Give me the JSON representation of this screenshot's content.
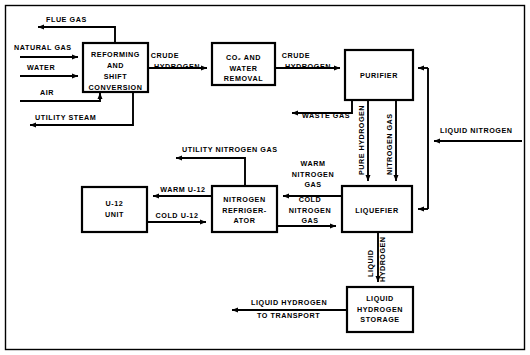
{
  "diagram": {
    "type": "process-flow-block-diagram",
    "colors": {
      "line": "#000000",
      "box_fill": "#ffffff",
      "background": "#ffffff"
    },
    "boxes": [
      {
        "id": "reforming",
        "lines": [
          "REFORMING",
          "AND",
          "SHIFT",
          "CONVERSION"
        ]
      },
      {
        "id": "co2-water",
        "lines": [
          "CO₂ AND",
          "WATER",
          "REMOVAL"
        ]
      },
      {
        "id": "purifier",
        "lines": [
          "PURIFIER"
        ]
      },
      {
        "id": "u12",
        "lines": [
          "U-12",
          "UNIT"
        ]
      },
      {
        "id": "nitrogen-refrigerator",
        "lines": [
          "NITROGEN",
          "REFRIGER-",
          "ATOR"
        ]
      },
      {
        "id": "liquefier",
        "lines": [
          "LIQUEFIER"
        ]
      },
      {
        "id": "lh2-storage",
        "lines": [
          "LIQUID",
          "HYDROGEN",
          "STORAGE"
        ]
      }
    ],
    "stream_labels": {
      "flue_gas": "FLUE GAS",
      "natural_gas": "NATURAL GAS",
      "water": "WATER",
      "air": "AIR",
      "utility_steam": "UTILITY STEAM",
      "crude_hydrogen_1": "CRUDE",
      "crude_hydrogen_2": "HYDROGEN",
      "crude_hydrogen_3": "CRUDE",
      "crude_hydrogen_4": "HYDROGEN",
      "waste_gas": "WASTE GAS",
      "pure_hydrogen": "PURE HYDROGEN",
      "nitrogen_gas": "NITROGEN GAS",
      "liquid_nitrogen": "LIQUID NITROGEN",
      "utility_nitrogen_gas": "UTILITY NITROGEN GAS",
      "warm_u12": "WARM U-12",
      "cold_u12": "COLD U-12",
      "warm_nitrogen_1": "WARM",
      "warm_nitrogen_2": "NITROGEN",
      "warm_nitrogen_3": "GAS",
      "cold_nitrogen_1": "COLD",
      "cold_nitrogen_2": "NITROGEN",
      "cold_nitrogen_3": "GAS",
      "liquid_hydrogen_v1": "LIQUID",
      "liquid_hydrogen_v2": "HYDROGEN",
      "lh2_transport_1": "LIQUID HYDROGEN",
      "lh2_transport_2": "TO TRANSPORT"
    }
  }
}
